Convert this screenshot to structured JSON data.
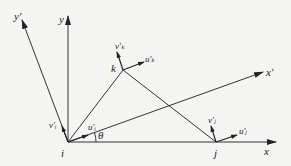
{
  "diagram": {
    "type": "triangular element with local and global coordinate systems",
    "colors": {
      "line": "#333333",
      "background": "#f4f4f2"
    },
    "nodes": [
      {
        "id": "i",
        "label": "i",
        "x": 68,
        "y": 142
      },
      {
        "id": "j",
        "label": "j",
        "x": 216,
        "y": 142
      },
      {
        "id": "k",
        "label": "k",
        "x": 123,
        "y": 70
      }
    ],
    "axes": {
      "global_x": {
        "label": "x"
      },
      "global_y": {
        "label": "y"
      },
      "local_x": {
        "label": "x'"
      },
      "local_y": {
        "label": "y'"
      }
    },
    "angle": {
      "label": "θ"
    },
    "displacements": {
      "u_i": "u'ᵢ",
      "v_i": "v'ᵢ",
      "u_j": "u'ⱼ",
      "v_j": "v'ⱼ",
      "u_k": "u'ₖ",
      "v_k": "v'ₖ"
    }
  }
}
